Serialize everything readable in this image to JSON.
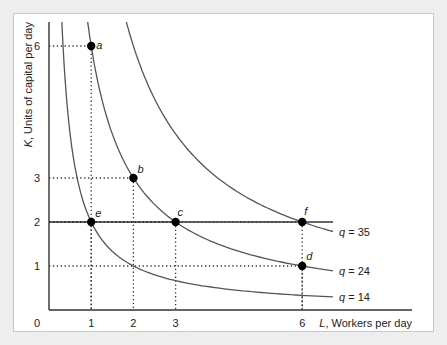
{
  "chart_data": {
    "type": "line",
    "title": "",
    "xlabel_var": "L",
    "xlabel_rest": ", Workers per day",
    "ylabel_var": "K",
    "ylabel_rest": ", Units of capital per day",
    "xlim": [
      0,
      7.6
    ],
    "ylim": [
      0,
      6.5
    ],
    "origin_label": "0",
    "x_ticks": [
      1,
      2,
      3,
      6
    ],
    "y_ticks": [
      1,
      2,
      3,
      6
    ],
    "isoquants": [
      {
        "name": "q = 14",
        "var": "q",
        "value": "14",
        "k_times_l": 2
      },
      {
        "name": "q = 24",
        "var": "q",
        "value": "24",
        "k_times_l": 6
      },
      {
        "name": "q = 35",
        "var": "q",
        "value": "35",
        "k_times_l": 12
      }
    ],
    "horizontal_line": {
      "y": 2
    },
    "points": [
      {
        "label": "a",
        "x": 1,
        "y": 6
      },
      {
        "label": "b",
        "x": 2,
        "y": 3
      },
      {
        "label": "c",
        "x": 3,
        "y": 2
      },
      {
        "label": "d",
        "x": 6,
        "y": 1
      },
      {
        "label": "e",
        "x": 1,
        "y": 2
      },
      {
        "label": "f",
        "x": 6,
        "y": 2
      }
    ],
    "grid": false,
    "colors": {
      "curve": "#555555",
      "axis": "#333333",
      "point": "#000000"
    }
  }
}
